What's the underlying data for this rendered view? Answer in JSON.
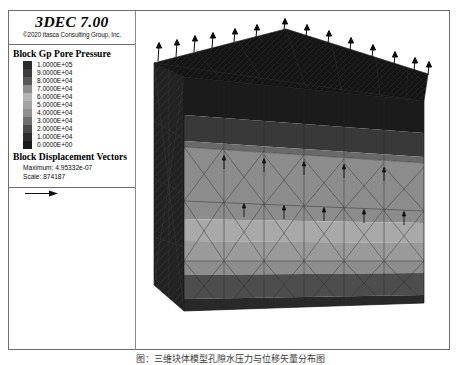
{
  "window": {
    "app_title": "3DEC 7.00",
    "copyright": "©2020 Itasca Consulting Group, Inc."
  },
  "legend": {
    "contour_heading": "Block Gp Pore Pressure",
    "contour_levels": [
      {
        "label": "1.0000E+05",
        "color": "#2b2b2b"
      },
      {
        "label": "9.0000E+04",
        "color": "#3d3d3d"
      },
      {
        "label": "8.0000E+04",
        "color": "#575757"
      },
      {
        "label": "7.0000E+04",
        "color": "#8c8c8c"
      },
      {
        "label": "6.0000E+04",
        "color": "#b4b4b4"
      },
      {
        "label": "5.0000E+04",
        "color": "#a3a3a3"
      },
      {
        "label": "4.0000E+04",
        "color": "#8f8f8f"
      },
      {
        "label": "3.0000E+04",
        "color": "#6f6f6f"
      },
      {
        "label": "2.0000E+04",
        "color": "#4a4a4a"
      },
      {
        "label": "1.0000E+04",
        "color": "#2e2e2e"
      },
      {
        "label": "0.0000E+00",
        "color": "#1a1a1a"
      }
    ],
    "vector_heading": "Block Displacement Vectors",
    "vector_maximum": "Maximum: 4.95332e-07",
    "vector_scale": "Scale: 874187"
  },
  "caption": {
    "text": "图：三维块体模型孔隙水压力与位移矢量分布图"
  },
  "chart_data": {
    "type": "heatmap",
    "title": "Block Gp Pore Pressure",
    "colorbar": {
      "label": "Block Gp Pore Pressure",
      "min": 0,
      "max": 100000,
      "tick_values": [
        100000,
        90000,
        80000,
        70000,
        60000,
        50000,
        40000,
        30000,
        20000,
        10000,
        0
      ],
      "tick_labels": [
        "1.0000E+05",
        "9.0000E+04",
        "8.0000E+04",
        "7.0000E+04",
        "6.0000E+04",
        "5.0000E+04",
        "4.0000E+04",
        "3.0000E+04",
        "2.0000E+04",
        "1.0000E+04",
        "0.0000E+00"
      ],
      "orientation": "vertical",
      "position": "left-panel"
    },
    "vectors": {
      "name": "Block Displacement Vectors",
      "maximum": 4.95332e-07,
      "scale": 874187,
      "count_top_surface": 18,
      "direction": "upward"
    },
    "front_face_bands": [
      {
        "band": 1,
        "value": 100000,
        "color": "#1c1c1c"
      },
      {
        "band": 2,
        "value": 90000,
        "color": "#3a3a3a"
      },
      {
        "band": 3,
        "value": 70000,
        "color": "#8d8d8d"
      },
      {
        "band": 4,
        "value": 60000,
        "color": "#a9a9a9"
      },
      {
        "band": 5,
        "value": 55000,
        "color": "#9e9e9e"
      },
      {
        "band": 6,
        "value": 45000,
        "color": "#949494"
      },
      {
        "band": 7,
        "value": 20000,
        "color": "#4e4e4e"
      },
      {
        "band": 8,
        "value": 5000,
        "color": "#262626"
      }
    ],
    "grid": false,
    "legend_position": "left"
  }
}
